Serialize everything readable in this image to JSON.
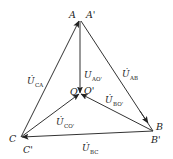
{
  "diagram": {
    "type": "phasor-diagram",
    "points": {
      "A": {
        "label": "A",
        "x": 80,
        "y": 20
      },
      "A_prime": {
        "label": "A'",
        "x": 80,
        "y": 20
      },
      "B": {
        "label": "B",
        "x": 153,
        "y": 131
      },
      "B_prime": {
        "label": "B'",
        "x": 153,
        "y": 131
      },
      "C": {
        "label": "C",
        "x": 21,
        "y": 137
      },
      "C_prime": {
        "label": "C'",
        "x": 21,
        "y": 137
      },
      "O": {
        "label": "O",
        "x": 80,
        "y": 94
      },
      "O_prime": {
        "label": "O'",
        "x": 80,
        "y": 94
      }
    },
    "phasors": [
      {
        "id": "U_CA",
        "symbol": "U",
        "dot": "̇",
        "sub": "CA",
        "from": "C",
        "to": "A"
      },
      {
        "id": "U_AB",
        "symbol": "U",
        "dot": "̇",
        "sub": "AB",
        "from": "B",
        "to": "A"
      },
      {
        "id": "U_BC",
        "symbol": "U",
        "dot": "̇",
        "sub": "BC",
        "from": "B",
        "to": "C"
      },
      {
        "id": "U_AO",
        "symbol": "U",
        "dot": "",
        "sub": "AO'",
        "from": "A",
        "to": "O"
      },
      {
        "id": "U_BO",
        "symbol": "U",
        "dot": "̇",
        "sub": "BO'",
        "from": "B",
        "to": "O"
      },
      {
        "id": "U_CO",
        "symbol": "U",
        "dot": "̇",
        "sub": "CO'",
        "from": "C",
        "to": "O"
      }
    ],
    "labels": {
      "A": "A",
      "A_prime": "A'",
      "B": "B",
      "B_prime": "B'",
      "C": "C",
      "C_prime": "C'",
      "O": "O",
      "O_prime": "O'",
      "U": "U",
      "Udot": "U̇",
      "sub_CA": "CA",
      "sub_AB": "AB",
      "sub_BC": "BC",
      "sub_AO": "AO'",
      "sub_BO": "BO'",
      "sub_CO": "CO'"
    },
    "line_color": "#333333"
  }
}
